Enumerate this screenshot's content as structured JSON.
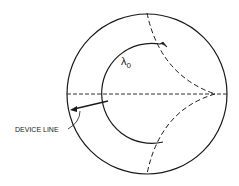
{
  "diagram": {
    "type": "smith-chart-sketch",
    "labels": {
      "lambda": "λ",
      "lambda_sub": "0",
      "device_line": "DEVICE LINE"
    },
    "colors": {
      "background": "#ffffff",
      "stroke": "#1a1a1a"
    }
  }
}
